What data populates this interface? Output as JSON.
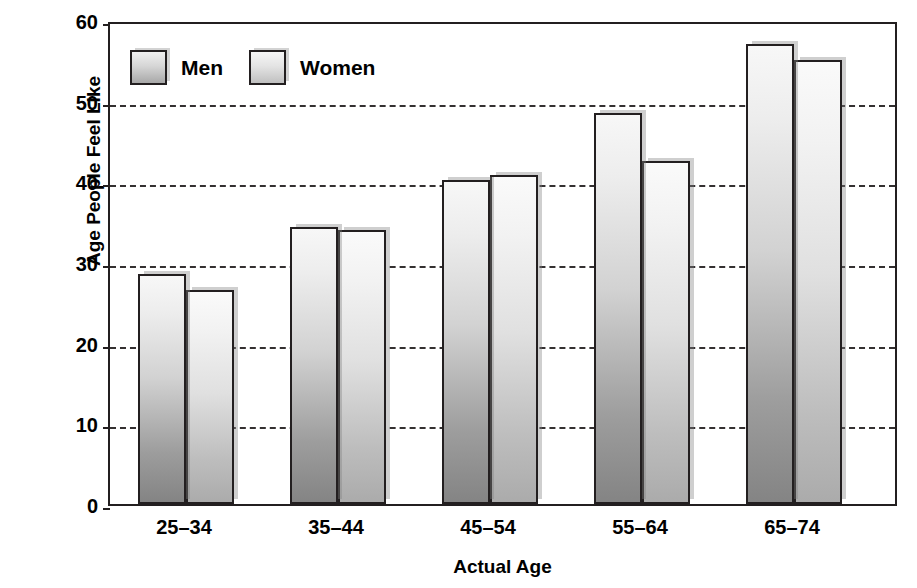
{
  "chart_data": {
    "type": "bar",
    "title": "",
    "xlabel": "Actual Age",
    "ylabel": "Age People Feel Like",
    "categories": [
      "25–34",
      "35–44",
      "45–54",
      "55–64",
      "65–74"
    ],
    "series": [
      {
        "name": "Men",
        "values": [
          28.5,
          34.3,
          40.2,
          48.5,
          57.0
        ],
        "color": "#9d9d9d"
      },
      {
        "name": "Women",
        "values": [
          26.5,
          34.0,
          40.8,
          42.5,
          55.0
        ],
        "color": "#c0c0c0"
      }
    ],
    "ylim": [
      0,
      60
    ],
    "yticks": [
      0,
      10,
      20,
      30,
      40,
      50,
      60
    ],
    "ytick_labels": [
      "0",
      "10",
      "20",
      "30",
      "40",
      "50",
      "60"
    ],
    "grid": true,
    "grid_style": "dashed",
    "grid_axis": "y",
    "legend_position": "top-left-inside",
    "legend": [
      "Men",
      "Women"
    ],
    "annotations": []
  },
  "axes": {
    "y_title": "Age People Feel Like",
    "x_title": "Actual Age"
  },
  "colors": {
    "axis": "#231f20",
    "gridline": "#231f20",
    "text": "#000000",
    "background": "#ffffff",
    "men_bar_top": "#f7f7f7",
    "men_bar_bottom": "#848484",
    "women_bar_top": "#fafafa",
    "women_bar_bottom": "#ababab"
  }
}
